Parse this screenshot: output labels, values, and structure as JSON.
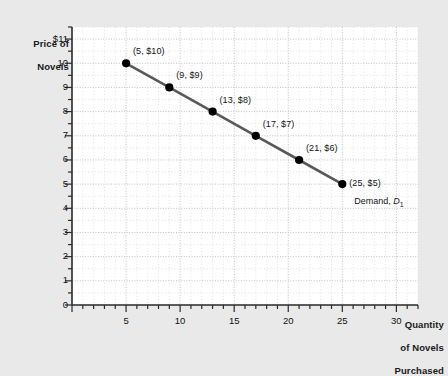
{
  "chart_data": {
    "type": "line",
    "title": "",
    "xlabel": "Quantity of Novels Purchased",
    "ylabel": "Price of Novels",
    "x": [
      5,
      9,
      13,
      17,
      21,
      25
    ],
    "values": [
      10,
      9,
      8,
      7,
      6,
      5
    ],
    "point_labels": [
      "(5, $10)",
      "(9, $9)",
      "(13, $8)",
      "(17, $7)",
      "(21, $6)",
      "(25, $5)"
    ],
    "series": [
      {
        "name": "Demand, D1",
        "values": [
          10,
          9,
          8,
          7,
          6,
          5
        ]
      }
    ],
    "xlim": [
      0,
      32
    ],
    "ylim": [
      0,
      11.5
    ],
    "xticks": [
      0,
      5,
      10,
      15,
      20,
      25,
      30
    ],
    "xtick_labels": [
      "0",
      "5",
      "10",
      "15",
      "20",
      "25",
      "30"
    ],
    "yticks": [
      1,
      2,
      3,
      4,
      5,
      6,
      7,
      8,
      9,
      10,
      11
    ],
    "ytick_labels": [
      "1",
      "2",
      "3",
      "4",
      "5",
      "6",
      "7",
      "8",
      "9",
      "10",
      "$11"
    ],
    "grid": true,
    "legend_position": "inline-right",
    "colors": {
      "line": "#58595b",
      "marker": "#000000",
      "grid": "#cfcfd4",
      "axis": "#2b2b2b",
      "background": "#e9e9e9",
      "plot_background": "#ffffff"
    }
  },
  "axes": {
    "y_title_line1": "Price of",
    "y_title_line2": "Novels",
    "x_title_line1": "Quantity",
    "x_title_line2": "of Novels",
    "x_title_line3": "Purchased",
    "origin_label": "0"
  },
  "series_annotation": {
    "prefix": "Demand, ",
    "symbol": "D",
    "subscript": "1"
  }
}
